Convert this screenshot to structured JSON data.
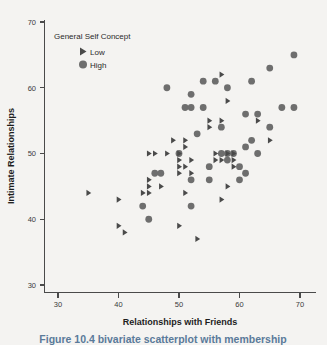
{
  "figure": {
    "caption": "Figure 10.4 bivariate scatterplot with membership"
  },
  "legend": {
    "title": "General Self Concept",
    "entries": [
      {
        "label": "Low",
        "marker": "triangle-right-icon",
        "color": "#4a4a4a"
      },
      {
        "label": "High",
        "marker": "circle-icon",
        "color": "#6e6e6e"
      }
    ]
  },
  "chart_data": {
    "type": "scatter",
    "title": "",
    "xlabel": "Relationships with Friends",
    "ylabel": "Intimate Relationships",
    "xlim": [
      27,
      73
    ],
    "ylim": [
      27,
      72
    ],
    "xticks": [
      30,
      40,
      50,
      60,
      70
    ],
    "yticks": [
      30,
      40,
      50,
      60,
      70
    ],
    "grid": false,
    "legend_position": "top-left-inside",
    "series": [
      {
        "name": "Low",
        "marker": "triangle",
        "color": "#4a4a4a",
        "points": [
          [
            35,
            44
          ],
          [
            40,
            43
          ],
          [
            40,
            39
          ],
          [
            41,
            38
          ],
          [
            44,
            44
          ],
          [
            45,
            44
          ],
          [
            45,
            45
          ],
          [
            45,
            50
          ],
          [
            45,
            46
          ],
          [
            46,
            50
          ],
          [
            47,
            45
          ],
          [
            48,
            50
          ],
          [
            49,
            52
          ],
          [
            50,
            50
          ],
          [
            50,
            49
          ],
          [
            50,
            48
          ],
          [
            50,
            47
          ],
          [
            50,
            39
          ],
          [
            51,
            44
          ],
          [
            51,
            48
          ],
          [
            51,
            52
          ],
          [
            51,
            51
          ],
          [
            52,
            49
          ],
          [
            52,
            47
          ],
          [
            53,
            37
          ],
          [
            55,
            55
          ],
          [
            55,
            54
          ],
          [
            56,
            50
          ],
          [
            56,
            49
          ],
          [
            57,
            55
          ],
          [
            57,
            62
          ],
          [
            57,
            49
          ],
          [
            57,
            43
          ],
          [
            58,
            58
          ],
          [
            58,
            50
          ],
          [
            58,
            45
          ],
          [
            59,
            50
          ],
          [
            59,
            49
          ],
          [
            59,
            48
          ],
          [
            63,
            55
          ],
          [
            65,
            52
          ]
        ]
      },
      {
        "name": "High",
        "marker": "circle",
        "color": "#6e6e6e",
        "points": [
          [
            44,
            42
          ],
          [
            45,
            40
          ],
          [
            46,
            47
          ],
          [
            47,
            47
          ],
          [
            48,
            60
          ],
          [
            50,
            50
          ],
          [
            51,
            57
          ],
          [
            52,
            57
          ],
          [
            52,
            59
          ],
          [
            52,
            42
          ],
          [
            52,
            46
          ],
          [
            53,
            53
          ],
          [
            54,
            61
          ],
          [
            54,
            57
          ],
          [
            55,
            46
          ],
          [
            55,
            48
          ],
          [
            56,
            61
          ],
          [
            57,
            50
          ],
          [
            57,
            54
          ],
          [
            58,
            50
          ],
          [
            58,
            60
          ],
          [
            58,
            49
          ],
          [
            59,
            50
          ],
          [
            60,
            46
          ],
          [
            60,
            48
          ],
          [
            61,
            56
          ],
          [
            61,
            51
          ],
          [
            61,
            47
          ],
          [
            62,
            52
          ],
          [
            62,
            61
          ],
          [
            63,
            56
          ],
          [
            63,
            50
          ],
          [
            65,
            54
          ],
          [
            65,
            63
          ],
          [
            67,
            57
          ],
          [
            69,
            57
          ],
          [
            69,
            65
          ]
        ]
      }
    ]
  }
}
